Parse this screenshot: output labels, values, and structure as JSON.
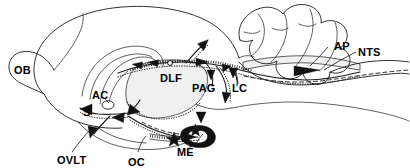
{
  "figure": {
    "background_color": "#ffffff",
    "line_color": "#1a1a1a",
    "gray_fill_color": "#f0f0f0",
    "dark_fill_color": "#111111",
    "width": 410,
    "height": 168
  },
  "labels": {
    "ob": "OB",
    "s": "S",
    "ac": "AC",
    "ovlt": "OVLT",
    "oc": "OC",
    "me": "MÉ",
    "dlf": "DLF",
    "pag": "PAG",
    "lc": "LC",
    "ap": "AP",
    "nts": "NTS"
  },
  "structures": [
    {
      "key": "ob",
      "name": "olfactory-bulb",
      "abbrev": "OB"
    },
    {
      "key": "s",
      "name": "septum",
      "abbrev": "S"
    },
    {
      "key": "ac",
      "name": "anterior-commissure",
      "abbrev": "AC"
    },
    {
      "key": "ovlt",
      "name": "organum-vasculosum-lamina-terminalis",
      "abbrev": "OVLT"
    },
    {
      "key": "oc",
      "name": "optic-chiasm",
      "abbrev": "OC"
    },
    {
      "key": "me",
      "name": "median-eminence",
      "abbrev": "MÉ"
    },
    {
      "key": "dlf",
      "name": "dorsal-longitudinal-fasciculus",
      "abbrev": "DLF"
    },
    {
      "key": "pag",
      "name": "periaqueductal-gray",
      "abbrev": "PAG"
    },
    {
      "key": "lc",
      "name": "locus-coeruleus",
      "abbrev": "LC"
    },
    {
      "key": "ap",
      "name": "area-postrema",
      "abbrev": "AP"
    },
    {
      "key": "nts",
      "name": "nucleus-tractus-solitarius",
      "abbrev": "NTS"
    }
  ],
  "markers": {
    "star_count": 2,
    "arrowhead_count": 14
  }
}
